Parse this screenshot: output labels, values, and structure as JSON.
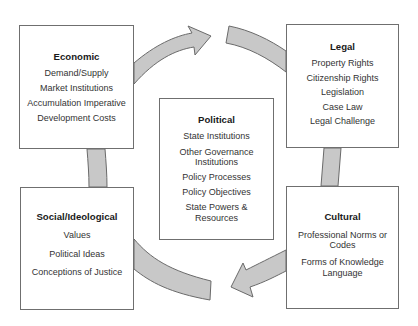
{
  "diagram": {
    "type": "cycle",
    "colors": {
      "arrow_fill": "#c8c8c8",
      "arrow_stroke": "#6a6a6a",
      "box_border": "#6f6f6f",
      "text": "#222222"
    },
    "boxes": {
      "economic": {
        "title": "Economic",
        "items": [
          "Demand/Supply",
          "Market Institutions",
          "Accumulation Imperative",
          "Development Costs"
        ]
      },
      "legal": {
        "title": "Legal",
        "items": [
          "Property Rights",
          "Citizenship Rights",
          "Legislation",
          "Case Law",
          "Legal Challenge"
        ]
      },
      "political": {
        "title": "Political",
        "items": [
          "State Institutions",
          "Other Governance Institutions",
          "Policy Processes",
          "Policy Objectives",
          "State Powers & Resources"
        ]
      },
      "social": {
        "title": "Social/Ideological",
        "items": [
          "Values",
          "Political Ideas",
          "Conceptions of Justice"
        ]
      },
      "cultural": {
        "title": "Cultural",
        "items": [
          "Professional Norms or Codes",
          "Forms of Knowledge Language"
        ]
      }
    },
    "flow": [
      {
        "from": "economic",
        "to": "legal",
        "direction": "clockwise"
      },
      {
        "from": "legal",
        "to": "cultural",
        "direction": "clockwise"
      },
      {
        "from": "cultural",
        "to": "social",
        "direction": "clockwise"
      },
      {
        "from": "social",
        "to": "economic",
        "direction": "clockwise"
      }
    ]
  }
}
